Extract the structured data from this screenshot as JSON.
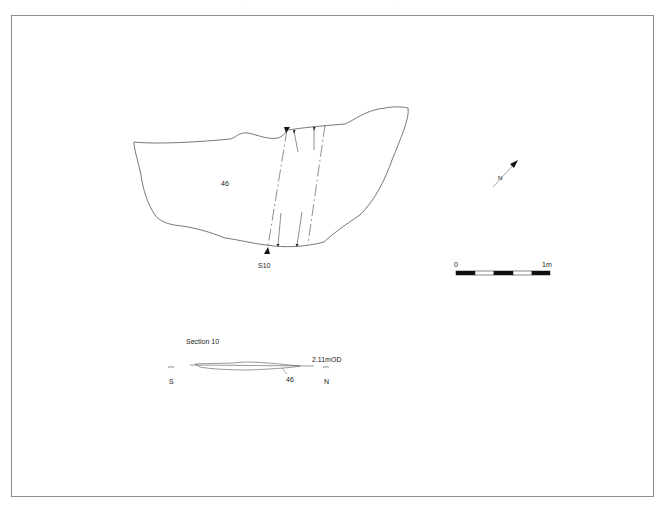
{
  "figure": {
    "type": "archaeological plan and section",
    "frame": {
      "stroke": "#8c8c8c"
    }
  },
  "plan": {
    "feature_label": "46",
    "section_marker": "S10",
    "outline_color": "#555555"
  },
  "north_arrow": {
    "label": "N"
  },
  "scale_bar": {
    "start_label": "0",
    "end_label": "1m",
    "segments": [
      "black",
      "white",
      "black",
      "white",
      "black"
    ]
  },
  "section": {
    "title": "Section 10",
    "datum_label": "2.11mOD",
    "left_end_label": "S",
    "right_end_label": "N",
    "fill_label": "46"
  }
}
